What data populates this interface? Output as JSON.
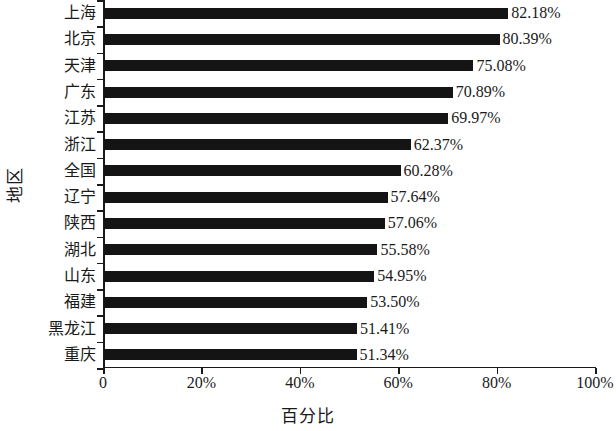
{
  "chart_data": {
    "type": "bar",
    "orientation": "horizontal",
    "title": "",
    "xlabel": "百分比",
    "ylabel": "地区",
    "xlim": [
      0,
      100
    ],
    "grid": false,
    "legend": null,
    "xticks": [
      "0",
      "20%",
      "40%",
      "60%",
      "80%",
      "100%"
    ],
    "xtick_values": [
      0,
      20,
      40,
      60,
      80,
      100
    ],
    "bar_color": "#141414",
    "axis_color": "#1a1a1a",
    "background_color": "#ffffff",
    "categories": [
      "上海",
      "北京",
      "天津",
      "广东",
      "江苏",
      "浙江",
      "全国",
      "辽宁",
      "陕西",
      "湖北",
      "山东",
      "福建",
      "黑龙江",
      "重庆"
    ],
    "values": [
      82.18,
      80.39,
      75.08,
      70.89,
      69.97,
      62.37,
      60.28,
      57.64,
      57.06,
      55.58,
      54.95,
      53.5,
      51.41,
      51.34
    ],
    "value_labels": [
      "82.18%",
      "80.39%",
      "75.08%",
      "70.89%",
      "69.97%",
      "62.37%",
      "60.28%",
      "57.64%",
      "57.06%",
      "55.58%",
      "54.95%",
      "53.50%",
      "51.41%",
      "51.34%"
    ]
  }
}
